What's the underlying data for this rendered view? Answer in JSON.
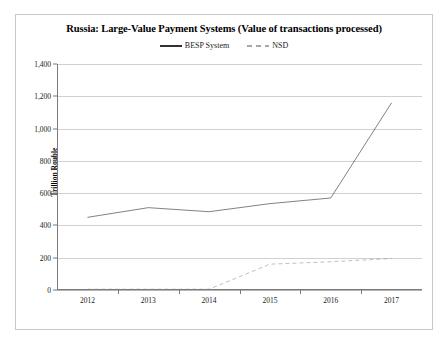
{
  "figure": {
    "title": "Russia: Large-Value Payment Systems (Value of transactions processed)",
    "y_axis_title": "Trillion Rouble",
    "frame_color": "#c8c8c8",
    "grid_color": "#d0d0d0"
  },
  "legend": {
    "position": "top-center",
    "items": [
      {
        "label": "BESP System",
        "style": "solid",
        "color": "#1a1a1a",
        "icon": "solid-line-swatch"
      },
      {
        "label": "NSD",
        "style": "dashed",
        "color": "#8a8a8a",
        "icon": "dashed-line-swatch"
      }
    ]
  },
  "chart_data": {
    "type": "line",
    "title": "Russia: Large-Value Payment Systems (Value of transactions processed)",
    "xlabel": "",
    "ylabel": "Trillion Rouble",
    "categories": [
      "2012",
      "2013",
      "2014",
      "2015",
      "2016",
      "2017"
    ],
    "ylim": [
      0,
      1400
    ],
    "ytick_values": [
      0,
      200,
      400,
      600,
      800,
      1000,
      1200,
      1400
    ],
    "ytick_labels": [
      "0",
      "200",
      "400",
      "600",
      "800",
      "1,000",
      "1,200",
      "1,400"
    ],
    "grid": "horizontal",
    "legend_position": "top-center",
    "series": [
      {
        "name": "BESP System",
        "style": "solid",
        "color": "#1a1a1a",
        "values": [
          450,
          510,
          485,
          535,
          570,
          1160
        ]
      },
      {
        "name": "NSD",
        "style": "dashed",
        "color": "#8a8a8a",
        "values": [
          5,
          5,
          5,
          160,
          175,
          195
        ]
      }
    ]
  }
}
